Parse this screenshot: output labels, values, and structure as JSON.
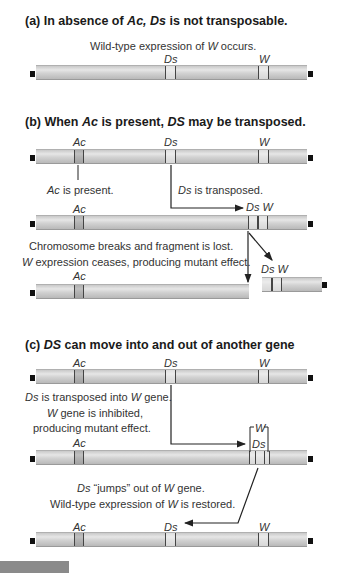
{
  "panels": {
    "a": {
      "title_prefix": "(a) In absence of ",
      "title_ac": "Ac,",
      "title_ds": " Ds",
      "title_suffix": " is not transposable.",
      "caption_pre": "Wild-type expression of ",
      "caption_w": "W",
      "caption_post": " occurs.",
      "labels": {
        "ds": "Ds",
        "w": "W"
      }
    },
    "b": {
      "title_prefix": "(b) When ",
      "title_ac": "Ac",
      "title_mid": " is present, ",
      "title_ds": "DS",
      "title_suffix": " may be transposed.",
      "labels": {
        "ac": "Ac",
        "ds": "Ds",
        "w": "W",
        "ds_w": "Ds W"
      },
      "note_ac_i": "Ac",
      "note_ac": " is present.",
      "note_ds_i": "Ds",
      "note_ds": " is transposed.",
      "break_line1": "Chromosome breaks and fragment is lost.",
      "break_line2_i": "W",
      "break_line2": " expression ceases, producing mutant effect."
    },
    "c": {
      "title_prefix": "(c) ",
      "title_ds": "DS",
      "title_suffix": " can move into and out of another gene",
      "labels": {
        "ac": "Ac",
        "ds": "Ds",
        "w": "W"
      },
      "into_i": "Ds",
      "into_mid": " is transposed into ",
      "into_w": "W",
      "into_end": " gene.",
      "inhib_w": "W",
      "inhib_line1": " gene is inhibited,",
      "inhib_line2": "producing mutant effect.",
      "jump_i": "Ds",
      "jump_mid": " “jumps” out of ",
      "jump_w": "W",
      "jump_end": " gene.",
      "restore_pre": "Wild-type expression of ",
      "restore_w": "W",
      "restore_post": " is restored."
    }
  },
  "colors": {
    "chromosome": "#d2d2d2",
    "ac_band": "#9a9a9a",
    "arrow": "#222222",
    "cap": "#111111",
    "corner_block": "#8a8a8a"
  }
}
